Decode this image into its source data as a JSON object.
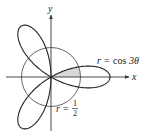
{
  "diagram": {
    "axes": {
      "x_label": "x",
      "y_label": "y"
    },
    "curves": [
      {
        "name": "rose",
        "equation_lhs": "r",
        "equation_eq": "=",
        "equation_rhs_func": "cos",
        "equation_rhs_arg": "3θ",
        "petals": 3,
        "max_radius": 1
      },
      {
        "name": "circle",
        "equation_lhs": "r",
        "equation_eq": "=",
        "numerator": "1",
        "denominator": "2",
        "radius": 0.5
      }
    ],
    "shaded_region": {
      "description": "Region inside both r = cos 3θ and r = 1/2, for 0 ≤ θ ≤ π/6",
      "fill": "#d8d8d8"
    },
    "colors": {
      "curve": "#222222",
      "circle": "#555555",
      "axis": "#333333",
      "shade": "#d8d8d8"
    }
  }
}
